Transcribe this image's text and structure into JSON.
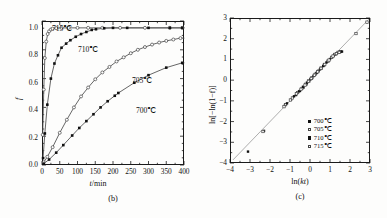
{
  "figure": {
    "panels": [
      {
        "id": "b",
        "caption": "(b)"
      },
      {
        "id": "c",
        "caption": "(c)"
      }
    ]
  },
  "panel_b": {
    "caption": "(b)",
    "xlabel_italic": "t",
    "xlabel_rest": "/min",
    "ylabel": "f",
    "xticks": [
      "0",
      "50",
      "100",
      "150",
      "200",
      "250",
      "300",
      "350",
      "400"
    ],
    "yticks": [
      "0.0",
      "0.2",
      "0.4",
      "0.6",
      "0.8",
      "1.0"
    ],
    "curve_labels": [
      {
        "text": "715℃",
        "series": "715C"
      },
      {
        "text": "710℃",
        "series": "710C"
      },
      {
        "text": "705℃",
        "series": "705C"
      },
      {
        "text": "700℃",
        "series": "700C"
      }
    ]
  },
  "panel_c": {
    "caption": "(c)",
    "xlabel_pre": "ln(",
    "xlabel_italic": "kt",
    "xlabel_post": ")",
    "ylabel": "ln[−ln(1−f)]",
    "xticks": [
      "−4",
      "−3",
      "−2",
      "−1",
      "0",
      "1",
      "2",
      "3"
    ],
    "yticks": [
      "3",
      "2",
      "1",
      "0",
      "−1",
      "−2",
      "−3",
      "−4"
    ],
    "legend": [
      {
        "label": "700℃",
        "marker": "filled-square"
      },
      {
        "label": "705℃",
        "marker": "open-square"
      },
      {
        "label": "710℃",
        "marker": "filled-square"
      },
      {
        "label": "715℃",
        "marker": "open-square"
      }
    ]
  },
  "colors": {
    "axis": "#1a1a1a",
    "curve": "#555555",
    "marker_filled": "#111111",
    "marker_open_edge": "#444444",
    "fit_line": "#999999"
  },
  "chart_data": [
    {
      "type": "line",
      "id": "panel-b",
      "title": "",
      "xlabel": "t/min",
      "ylabel": "f",
      "xlim": [
        0,
        400
      ],
      "ylim": [
        0,
        1.05
      ],
      "grid": false,
      "legend_position": "inline-annotations",
      "series": [
        {
          "name": "715℃",
          "marker": "open-circle",
          "x": [
            2,
            5,
            8,
            12,
            16,
            20,
            25,
            30,
            40,
            55,
            75,
            100,
            130,
            170,
            220,
            290,
            360,
            395
          ],
          "y": [
            0.22,
            0.55,
            0.78,
            0.9,
            0.955,
            0.975,
            0.988,
            0.994,
            0.998,
            1.0,
            1.0,
            1.0,
            1.0,
            1.0,
            1.0,
            1.0,
            1.0,
            1.0
          ]
        },
        {
          "name": "710℃",
          "marker": "filled-square",
          "x": [
            3,
            8,
            15,
            25,
            35,
            45,
            55,
            68,
            80,
            95,
            110,
            125,
            140,
            152,
            175,
            200,
            240,
            300,
            360,
            395
          ],
          "y": [
            0.05,
            0.23,
            0.44,
            0.63,
            0.74,
            0.8,
            0.855,
            0.885,
            0.91,
            0.935,
            0.955,
            0.97,
            0.985,
            0.99,
            0.997,
            1.0,
            1.0,
            1.0,
            1.0,
            1.0
          ]
        },
        {
          "name": "705℃",
          "marker": "open-circle",
          "x": [
            5,
            15,
            30,
            50,
            70,
            90,
            110,
            130,
            150,
            170,
            190,
            210,
            230,
            250,
            270,
            290,
            310,
            330,
            350,
            370,
            390
          ],
          "y": [
            0.02,
            0.06,
            0.13,
            0.235,
            0.33,
            0.42,
            0.5,
            0.565,
            0.625,
            0.675,
            0.715,
            0.755,
            0.785,
            0.815,
            0.84,
            0.86,
            0.878,
            0.893,
            0.905,
            0.915,
            0.925
          ]
        },
        {
          "name": "700℃",
          "marker": "filled-square",
          "x": [
            5,
            20,
            40,
            60,
            85,
            105,
            125,
            145,
            165,
            185,
            205,
            215,
            260,
            300,
            350,
            395
          ],
          "y": [
            0.01,
            0.04,
            0.09,
            0.145,
            0.215,
            0.27,
            0.32,
            0.37,
            0.42,
            0.465,
            0.505,
            0.525,
            0.6,
            0.655,
            0.71,
            0.745
          ]
        }
      ]
    },
    {
      "type": "scatter",
      "id": "panel-c",
      "title": "",
      "xlabel": "ln(kt)",
      "ylabel": "ln[−ln(1−f)]",
      "xlim": [
        -4,
        3
      ],
      "ylim": [
        -4,
        3
      ],
      "grid": false,
      "legend_position": "bottom-right",
      "fit_line": {
        "slope": 1.0,
        "intercept": 0.0,
        "x0": -3.85,
        "x1": 2.95
      },
      "series": [
        {
          "name": "700℃",
          "marker": "filled-square",
          "x": [
            -3.1,
            -2.3,
            -1.25,
            -0.95,
            -0.7,
            -0.5,
            -0.33,
            -0.18,
            -0.05,
            0.08,
            0.2,
            0.3,
            0.42,
            0.55,
            0.7,
            0.9,
            1.1,
            1.3,
            1.45,
            1.55
          ],
          "y": [
            -3.45,
            -2.45,
            -1.2,
            -0.95,
            -0.72,
            -0.52,
            -0.36,
            -0.2,
            -0.05,
            0.08,
            0.22,
            0.32,
            0.45,
            0.58,
            0.72,
            0.92,
            1.1,
            1.26,
            1.33,
            1.37
          ]
        },
        {
          "name": "705℃",
          "marker": "open-square",
          "x": [
            -2.35,
            -1.22,
            -0.88,
            -0.62,
            -0.4,
            -0.22,
            -0.06,
            0.1,
            0.26,
            0.4,
            0.56,
            0.72,
            0.9,
            1.08,
            1.24,
            1.4,
            1.52,
            2.85
          ],
          "y": [
            -2.48,
            -1.18,
            -0.86,
            -0.6,
            -0.4,
            -0.2,
            -0.04,
            0.12,
            0.28,
            0.42,
            0.58,
            0.74,
            0.92,
            1.1,
            1.24,
            1.34,
            1.38,
            2.8
          ]
        },
        {
          "name": "710℃",
          "marker": "filled-square",
          "x": [
            -1.15,
            -0.8,
            -0.55,
            -0.35,
            -0.15,
            0.02,
            0.18,
            0.34,
            0.5,
            0.66,
            0.82,
            1.0,
            1.18,
            1.35,
            1.5,
            1.6
          ],
          "y": [
            -1.12,
            -0.78,
            -0.54,
            -0.32,
            -0.12,
            0.04,
            0.2,
            0.36,
            0.52,
            0.68,
            0.85,
            1.02,
            1.18,
            1.3,
            1.36,
            1.38
          ]
        },
        {
          "name": "715℃",
          "marker": "open-square",
          "x": [
            -1.3,
            -0.98,
            -0.68,
            -0.45,
            -0.25,
            -0.08,
            0.06,
            0.22,
            0.38,
            0.55,
            0.74,
            0.95,
            1.15,
            1.32,
            1.46,
            2.3
          ],
          "y": [
            -1.28,
            -0.96,
            -0.66,
            -0.44,
            -0.24,
            -0.06,
            0.08,
            0.24,
            0.4,
            0.57,
            0.76,
            0.97,
            1.16,
            1.28,
            1.34,
            2.25
          ]
        }
      ]
    }
  ]
}
